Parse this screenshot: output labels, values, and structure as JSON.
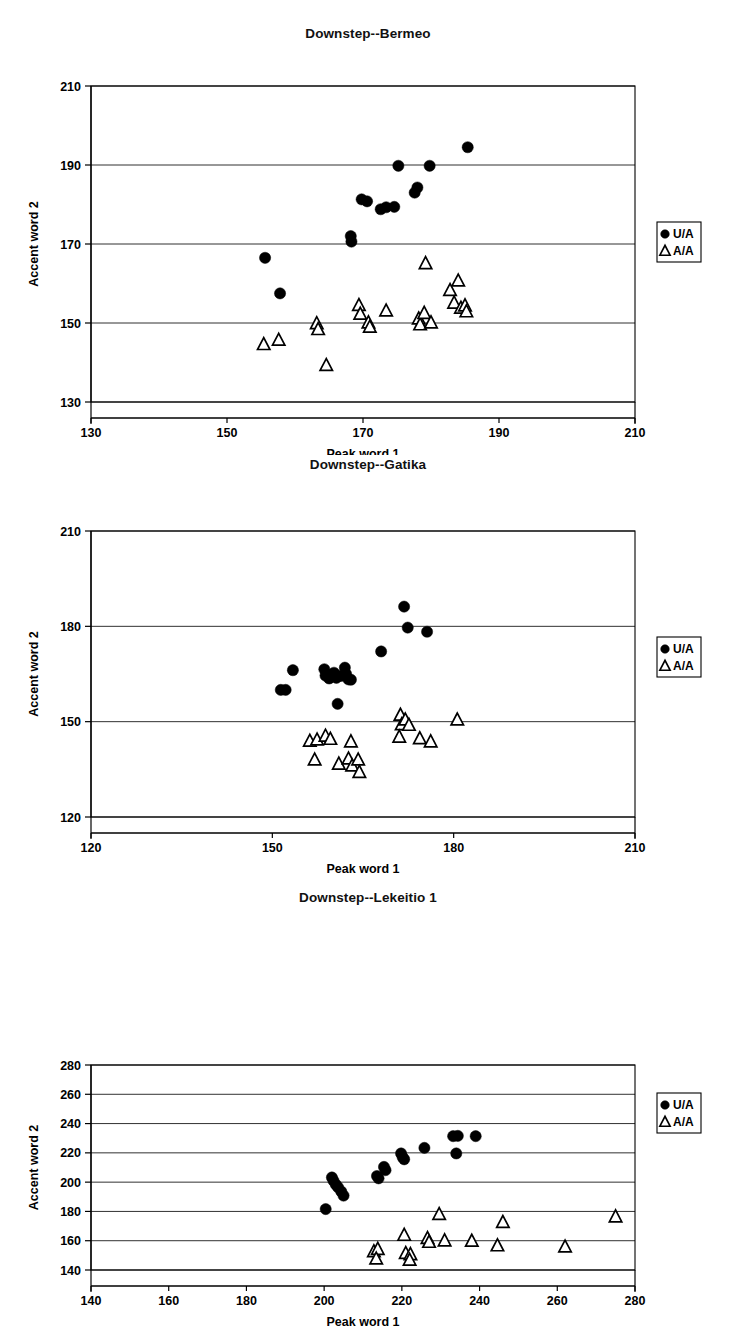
{
  "figure": {
    "axis_x_label": "Peak word 1",
    "axis_y_label": "Accent word 2",
    "legend": [
      {
        "key": "UA",
        "label": "U/A",
        "marker": "filled-circle"
      },
      {
        "key": "AA",
        "label": "A/A",
        "marker": "open-triangle"
      }
    ]
  },
  "chart_data": [
    {
      "type": "scatter",
      "title": "Downstep--Bermeo",
      "xlabel": "Peak word 1",
      "ylabel": "Accent word 2",
      "xlim": [
        130,
        210
      ],
      "ylim": [
        130,
        210
      ],
      "xticks": [
        130,
        150,
        170,
        190,
        210
      ],
      "yticks": [
        130,
        150,
        170,
        190,
        210
      ],
      "grid": true,
      "legend_position": "right",
      "series": [
        {
          "name": "U/A",
          "marker": "filled-circle",
          "points": [
            [
              155.6,
              166.5
            ],
            [
              157.8,
              157.5
            ],
            [
              168.2,
              172.0
            ],
            [
              168.3,
              170.6
            ],
            [
              169.8,
              181.3
            ],
            [
              170.6,
              180.8
            ],
            [
              172.6,
              178.8
            ],
            [
              173.4,
              179.3
            ],
            [
              174.6,
              179.4
            ],
            [
              175.2,
              189.8
            ],
            [
              177.6,
              183.0
            ],
            [
              178.0,
              184.3
            ],
            [
              179.8,
              189.8
            ],
            [
              185.4,
              194.5
            ]
          ]
        },
        {
          "name": "A/A",
          "marker": "open-triangle",
          "points": [
            [
              155.4,
              144.5
            ],
            [
              157.6,
              145.6
            ],
            [
              163.2,
              149.8
            ],
            [
              163.4,
              148.3
            ],
            [
              164.6,
              139.2
            ],
            [
              169.4,
              154.4
            ],
            [
              169.6,
              152.2
            ],
            [
              170.8,
              150.0
            ],
            [
              171.0,
              148.9
            ],
            [
              173.4,
              153.0
            ],
            [
              178.2,
              151.0
            ],
            [
              178.4,
              149.5
            ],
            [
              179.0,
              152.4
            ],
            [
              179.2,
              165.0
            ],
            [
              180.0,
              150.0
            ],
            [
              182.8,
              158.2
            ],
            [
              183.4,
              155.0
            ],
            [
              184.0,
              160.6
            ],
            [
              184.4,
              153.7
            ],
            [
              185.0,
              154.3
            ],
            [
              185.2,
              152.8
            ]
          ]
        }
      ]
    },
    {
      "type": "scatter",
      "title": "Downstep--Gatika",
      "xlabel": "Peak word 1",
      "ylabel": "Accent word 2",
      "xlim": [
        120,
        210
      ],
      "ylim": [
        120,
        210
      ],
      "xticks": [
        120,
        150,
        180,
        210
      ],
      "yticks": [
        120,
        150,
        180,
        210
      ],
      "grid": true,
      "legend_position": "right",
      "series": [
        {
          "name": "U/A",
          "marker": "filled-circle",
          "points": [
            [
              151.4,
              160.0
            ],
            [
              152.2,
              160.0
            ],
            [
              153.4,
              166.2
            ],
            [
              158.6,
              166.5
            ],
            [
              158.8,
              164.5
            ],
            [
              159.4,
              163.6
            ],
            [
              160.2,
              165.4
            ],
            [
              160.6,
              163.8
            ],
            [
              161.4,
              164.4
            ],
            [
              162.0,
              167.0
            ],
            [
              162.2,
              165.0
            ],
            [
              162.6,
              163.3
            ],
            [
              163.0,
              163.2
            ],
            [
              160.8,
              155.6
            ],
            [
              168.0,
              172.1
            ],
            [
              171.8,
              186.2
            ],
            [
              172.4,
              179.6
            ],
            [
              175.6,
              178.3
            ]
          ]
        },
        {
          "name": "A/A",
          "marker": "open-triangle",
          "points": [
            [
              156.2,
              143.8
            ],
            [
              157.4,
              144.2
            ],
            [
              158.8,
              145.4
            ],
            [
              159.6,
              144.4
            ],
            [
              157.0,
              137.9
            ],
            [
              161.0,
              136.6
            ],
            [
              162.6,
              138.2
            ],
            [
              163.2,
              136.0
            ],
            [
              164.2,
              137.9
            ],
            [
              164.4,
              134.0
            ],
            [
              163.0,
              143.6
            ],
            [
              171.2,
              152.0
            ],
            [
              171.4,
              149.0
            ],
            [
              172.0,
              150.5
            ],
            [
              172.6,
              148.8
            ],
            [
              171.0,
              145.1
            ],
            [
              174.4,
              144.6
            ],
            [
              176.2,
              143.6
            ],
            [
              180.6,
              150.5
            ]
          ]
        }
      ]
    },
    {
      "type": "scatter",
      "title": "Downstep--Lekeitio 1",
      "xlabel": "Peak word 1",
      "ylabel": "Accent word 2",
      "xlim": [
        140,
        280
      ],
      "ylim": [
        140,
        280
      ],
      "xticks": [
        140,
        160,
        180,
        200,
        220,
        240,
        260,
        280
      ],
      "yticks": [
        140,
        160,
        180,
        200,
        220,
        240,
        260,
        280
      ],
      "grid": true,
      "legend_position": "right",
      "series": [
        {
          "name": "U/A",
          "marker": "filled-circle",
          "points": [
            [
              200.4,
              181.6
            ],
            [
              202.0,
              203.2
            ],
            [
              202.4,
              201.0
            ],
            [
              203.0,
              198.4
            ],
            [
              203.6,
              196.4
            ],
            [
              204.4,
              193.6
            ],
            [
              205.0,
              190.8
            ],
            [
              213.6,
              204.2
            ],
            [
              214.0,
              202.6
            ],
            [
              215.4,
              210.4
            ],
            [
              215.8,
              208.2
            ],
            [
              219.8,
              219.6
            ],
            [
              220.2,
              217.0
            ],
            [
              220.6,
              215.6
            ],
            [
              225.8,
              223.4
            ],
            [
              233.2,
              231.4
            ],
            [
              234.4,
              231.6
            ],
            [
              234.0,
              219.6
            ],
            [
              239.0,
              231.4
            ]
          ]
        },
        {
          "name": "A/A",
          "marker": "open-triangle",
          "points": [
            [
              212.8,
              152.4
            ],
            [
              213.8,
              154.0
            ],
            [
              213.4,
              147.4
            ],
            [
              221.0,
              151.2
            ],
            [
              222.2,
              150.4
            ],
            [
              222.0,
              146.6
            ],
            [
              220.6,
              163.6
            ],
            [
              226.6,
              161.4
            ],
            [
              227.0,
              158.8
            ],
            [
              229.6,
              177.8
            ],
            [
              231.0,
              159.8
            ],
            [
              238.0,
              159.6
            ],
            [
              244.6,
              156.4
            ],
            [
              246.0,
              172.4
            ],
            [
              262.0,
              155.6
            ],
            [
              275.0,
              176.2
            ]
          ]
        }
      ]
    }
  ]
}
